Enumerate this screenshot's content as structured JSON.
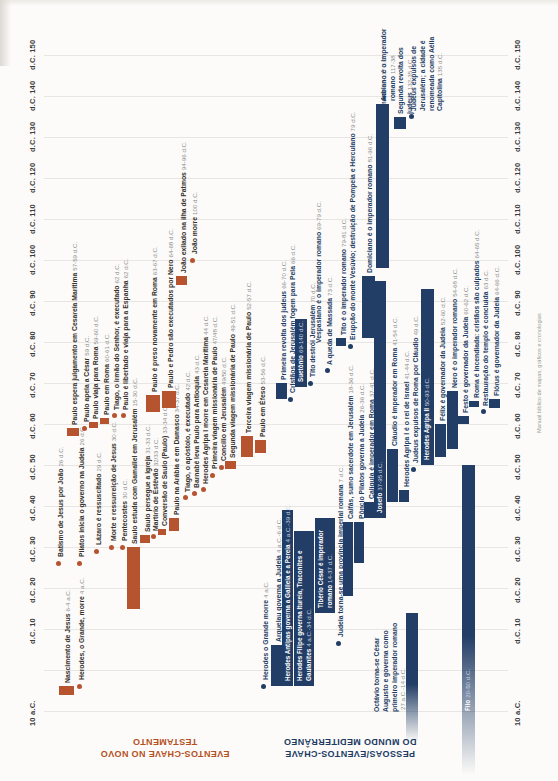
{
  "page": {
    "caption_right": "Manual bíblico de mapas, gráficos e cronologias"
  },
  "chart_data": {
    "type": "bar",
    "subtype": "gantt-timeline-vertical",
    "axis": {
      "start_year": -10,
      "end_year": 150,
      "top_y": 55,
      "px_per_year": 4.1,
      "grid_x1": 44,
      "grid_x2": 508,
      "left_tick_x": 28,
      "right_tick_x": 513,
      "gridline_years": [
        -10,
        0,
        10,
        20,
        30,
        40,
        50,
        60,
        70,
        80,
        90,
        100,
        110,
        120,
        130,
        140,
        150
      ],
      "ticks": [
        {
          "year": -10,
          "label": "10 a.C."
        },
        {
          "year": 10,
          "label": "d.C. 10"
        },
        {
          "year": 20,
          "label": "d.C. 20"
        },
        {
          "year": 30,
          "label": "d.C. 30"
        },
        {
          "year": 40,
          "label": "d.C. 40"
        },
        {
          "year": 50,
          "label": "d.C. 50"
        },
        {
          "year": 60,
          "label": "d.C. 60"
        },
        {
          "year": 70,
          "label": "d.C. 70"
        },
        {
          "year": 80,
          "label": "d.C. 80"
        },
        {
          "year": 90,
          "label": "d.C. 90"
        },
        {
          "year": 100,
          "label": "d.C. 100"
        },
        {
          "year": 110,
          "label": "d.C. 110"
        },
        {
          "year": 120,
          "label": "d.C. 120"
        },
        {
          "year": 130,
          "label": "d.C. 130"
        },
        {
          "year": 140,
          "label": "d.C. 140"
        },
        {
          "year": 150,
          "label": "d.C. 150"
        }
      ]
    },
    "sections": [
      {
        "id": "nt",
        "title_lines": [
          "EVENTOS-CHAVE NO NOVO",
          "TESTAMENTO"
        ],
        "title_color": "#b5501f",
        "marker_color": "#b65430",
        "title_left": 65,
        "title_top": 736,
        "title_width": 200
      },
      {
        "id": "med",
        "title_lines": [
          "PESSOAS/EVENTOS-CHAVE",
          "DO MUNDO MEDITERRÂNEO"
        ],
        "title_color": "#1d3c64",
        "marker_color": "#223d66",
        "title_left": 235,
        "title_top": 736,
        "title_width": 230
      }
    ],
    "events": [
      {
        "section": "nt",
        "label": "Nascimento de Jesus",
        "date": "6-4 a.C.",
        "start": -6,
        "end": -4,
        "marker": "bar",
        "x": 64,
        "bx": 59,
        "w": 15
      },
      {
        "section": "nt",
        "label": "Herodes, o Grande, morre",
        "date": "4 a.C.",
        "start": -4,
        "marker": "dot",
        "x": 78
      },
      {
        "section": "nt",
        "label": "Batismo de Jesus por João",
        "date": "26 d.C.",
        "start": 26,
        "marker": "dot",
        "x": 57
      },
      {
        "section": "nt",
        "label": "Pilatos inicia o governo na Judeia",
        "date": "26 d.C.",
        "start": 26,
        "marker": "dot",
        "x": 78
      },
      {
        "section": "nt",
        "label": "Lázaro é ressuscitado",
        "date": "29 d.C.",
        "start": 29,
        "marker": "dot",
        "x": 95
      },
      {
        "section": "nt",
        "label": "Morte e ressurreição de Jesus",
        "date": "30 d.C.",
        "start": 30,
        "marker": "dot",
        "x": 110
      },
      {
        "section": "nt",
        "label": "Pentecostes",
        "date": "30 d.C.",
        "start": 30,
        "marker": "dot",
        "x": 121
      },
      {
        "section": "nt",
        "label": "Saulo estuda com Gamaliel em Jerusalém",
        "date": "15-30 d.C.",
        "start": 15,
        "end": 30,
        "marker": "bar",
        "x": 131,
        "bx": 127,
        "w": 13
      },
      {
        "section": "nt",
        "label": "Saulo persegue a igreja",
        "date": "31-33 d.C.",
        "start": 31,
        "end": 33,
        "marker": "bar",
        "x": 144,
        "bx": 140,
        "w": 10
      },
      {
        "section": "nt",
        "label": "Martírio de Estêvão",
        "date": "32/33 d.C.",
        "start": 32.5,
        "marker": "dot",
        "x": 152
      },
      {
        "section": "nt",
        "label": "Conversão de Saulo (Paulo)",
        "date": "33-34 d.C.",
        "start": 33,
        "end": 34.5,
        "marker": "bar",
        "x": 161,
        "bx": 158,
        "w": 8
      },
      {
        "section": "nt",
        "label": "Paulo na Arábia e em Damasco",
        "date": "34-37 d.C.",
        "start": 34,
        "end": 37,
        "marker": "bar",
        "x": 173,
        "bx": 169,
        "w": 10
      },
      {
        "section": "nt",
        "label": "Tiago, o apóstolo, é executado",
        "date": "42 d.C.",
        "start": 42,
        "marker": "dot",
        "x": 184
      },
      {
        "section": "nt",
        "label": "Barnabé leva Paulo para Antioquia",
        "date": "43 d.C.",
        "start": 43,
        "marker": "dot",
        "x": 193
      },
      {
        "section": "nt",
        "label": "Herodes Agripa I morre em Cesareia Marítima",
        "date": "44 d.C.",
        "start": 44,
        "marker": "dot",
        "x": 202
      },
      {
        "section": "nt",
        "label": "Primeira viagem missionária de Paulo",
        "date": "47/48 d.C.",
        "start": 47.5,
        "marker": "dot",
        "x": 211
      },
      {
        "section": "nt",
        "label": "Concílio em Jerusalém",
        "date": "49/50 d.C.",
        "start": 49.5,
        "marker": "dot",
        "x": 220
      },
      {
        "section": "nt",
        "label": "Segunda viagem missionária de Paulo",
        "date": "49-51 d.C.",
        "start": 49,
        "end": 51,
        "marker": "bar",
        "x": 229,
        "bx": 225,
        "w": 11
      },
      {
        "section": "nt",
        "label": "Terceira viagem missionária de Paulo",
        "date": "52-57 d.C.",
        "start": 52,
        "end": 57,
        "marker": "bar",
        "x": 245,
        "bx": 241,
        "w": 12
      },
      {
        "section": "nt",
        "label": "Paulo em Éfeso",
        "date": "53-56 d.C.",
        "start": 53,
        "end": 56,
        "marker": "bar",
        "x": 259,
        "bx": 255,
        "w": 11
      },
      {
        "section": "nt",
        "label": "Paulo espera julgamento em Cesareia Marítima",
        "date": "57-59 d.C.",
        "start": 57,
        "end": 59,
        "marker": "bar",
        "x": 71,
        "bx": 67,
        "w": 12
      },
      {
        "section": "nt",
        "label": "Paulo apela a César",
        "date": "59 d.C.",
        "start": 59,
        "marker": "dot",
        "x": 83
      },
      {
        "section": "nt",
        "label": "Paulo viaja para Roma",
        "date": "59-60 d.C.",
        "start": 59,
        "end": 60.5,
        "marker": "bar",
        "x": 92,
        "bx": 89,
        "w": 9
      },
      {
        "section": "nt",
        "label": "Paulo em Roma",
        "date": "60-61 d.C.",
        "start": 60,
        "end": 61.5,
        "marker": "bar",
        "x": 103,
        "bx": 100,
        "w": 9
      },
      {
        "section": "nt",
        "label": "Tiago, o irmão do Senhor, é executado",
        "date": "62 d.C.",
        "start": 62,
        "marker": "dot",
        "x": 113
      },
      {
        "section": "nt",
        "label": "Paulo é libertado e viaja para a Espanha",
        "date": "62 d.C.",
        "start": 62,
        "marker": "dot",
        "x": 122
      },
      {
        "section": "nt",
        "label": "Paulo é preso novamente em Roma",
        "date": "63-67 d.C.",
        "start": 63,
        "end": 67,
        "marker": "bar",
        "x": 151,
        "bx": 146,
        "w": 14
      },
      {
        "section": "nt",
        "label": "Paulo e Pedro são executados por Nero",
        "date": "64-68 d.C.",
        "start": 64,
        "end": 68,
        "marker": "bar",
        "x": 167,
        "bx": 162,
        "w": 14
      },
      {
        "section": "nt",
        "label": "João exilado na ilha de Patmos",
        "date": "94-96 d.C.",
        "start": 94,
        "end": 96,
        "marker": "bar",
        "x": 180,
        "bx": 176,
        "w": 11
      },
      {
        "section": "nt",
        "label": "João morre",
        "date": "100 d.C.",
        "start": 100,
        "marker": "dot",
        "x": 191
      },
      {
        "section": "med",
        "label": "Herodes o Grande morre",
        "date": "4 a.C.",
        "start": -4,
        "marker": "dot",
        "x": 262
      },
      {
        "section": "med",
        "label": "Arquelau governa a Judeia",
        "date": "4 a.C.-6 d.C.",
        "start": -4,
        "end": 6,
        "marker": "bar",
        "x": 275,
        "bx": 271,
        "w": 11
      },
      {
        "section": "med",
        "label": "Herodes Antipas governa a Galileia e a Pereia",
        "date": "4 a.C.-39 d.C.",
        "start": -4,
        "end": 39,
        "marker": "bar",
        "inside": true,
        "x": 284,
        "bx": 282,
        "w": 11
      },
      {
        "section": "med",
        "lines": [
          "Herodes Filipe governa Itureia, Traconites e",
          "Gaulanites"
        ],
        "label": "Herodes Filipe governa Itureia, Traconites e Gaulanites",
        "date": "4 a.C.-34 d.C.",
        "start": -4,
        "end": 34,
        "marker": "bar",
        "inside": true,
        "x": 297,
        "bx": 294,
        "w": 20
      },
      {
        "section": "med",
        "lines": [
          "Tibério César é imperador",
          "romano"
        ],
        "label": "Tibério César é imperador romano",
        "date": "14-37 d.C.",
        "start": 14,
        "end": 37,
        "marker": "bar",
        "inside": true,
        "x": 318,
        "bx": 315,
        "w": 20
      },
      {
        "section": "med",
        "label": "Judeia torna-se uma província imperial romana",
        "date": "7 d.C.",
        "start": 6.5,
        "marker": "dot",
        "x": 337
      },
      {
        "section": "med",
        "label": "Caifás, sumo sacerdote em Jerusalém",
        "date": "18-36 d.C.",
        "start": 18,
        "end": 36,
        "marker": "bar",
        "x": 347,
        "bx": 343,
        "w": 10
      },
      {
        "section": "med",
        "label": "Pôncio Pilatos governa a Judeia",
        "date": "26-36 d.C.",
        "start": 26,
        "end": 36,
        "marker": "bar",
        "x": 358,
        "bx": 354,
        "w": 10
      },
      {
        "section": "med",
        "label": "Calígula é imperador em Roma",
        "date": "37-41 d.C.",
        "start": 37,
        "end": 41,
        "marker": "bar",
        "x": 368,
        "bx": 364,
        "w": 10
      },
      {
        "section": "med",
        "label": "Josefo",
        "date": "37-95 d.C.",
        "start": 37,
        "end": 95,
        "marker": "bar",
        "inside": true,
        "x": 377,
        "bx": 374,
        "w": 12
      },
      {
        "section": "med",
        "label": "Cláudio é imperador em Roma",
        "date": "41-54 d.C.",
        "start": 41,
        "end": 54,
        "marker": "bar",
        "x": 391,
        "bx": 387,
        "w": 11
      },
      {
        "section": "med",
        "label": "Herodes Agripa I é o rei de Israel",
        "date": "41-44 d.C.",
        "start": 41,
        "end": 44,
        "marker": "bar",
        "x": 403,
        "bx": 399,
        "w": 10
      },
      {
        "section": "med",
        "label": "Judeus expulsos de Roma por Cláudio",
        "date": "49 d.C.",
        "start": 49,
        "marker": "dot",
        "x": 412
      },
      {
        "section": "med",
        "label": "Herodes Agripa II",
        "date": "50-93 d.C.",
        "start": 50,
        "end": 93,
        "marker": "bar",
        "inside": true,
        "x": 424,
        "bx": 421,
        "w": 13
      },
      {
        "section": "med",
        "label": "Félix é governador da Judeia",
        "date": "52-60 d.C.",
        "start": 52,
        "end": 60,
        "marker": "bar",
        "x": 439,
        "bx": 435,
        "w": 11
      },
      {
        "section": "med",
        "label": "Nero é o imperador romano",
        "date": "54-68 d.C.",
        "start": 54,
        "end": 68,
        "marker": "bar",
        "x": 451,
        "bx": 447,
        "w": 11
      },
      {
        "section": "med",
        "label": "Festo é governador da Judeia",
        "date": "60-62 d.C.",
        "start": 60,
        "end": 62,
        "marker": "bar",
        "x": 462,
        "bx": 458,
        "w": 11
      },
      {
        "section": "med",
        "label": "Roma é incendiada: cristãos são culpados",
        "date": "64-65 d.C.",
        "start": 64,
        "end": 65.5,
        "marker": "bar",
        "x": 473,
        "bx": 469,
        "w": 10
      },
      {
        "section": "med",
        "label": "Restauração do templo é concluída",
        "date": "63 d.C.",
        "start": 63,
        "marker": "dot",
        "x": 482
      },
      {
        "section": "med",
        "label": "Flórus é governador da Judeia",
        "date": "64-66 d.C.",
        "start": 64,
        "end": 66,
        "marker": "bar",
        "x": 493,
        "bx": 489,
        "w": 11
      },
      {
        "section": "med",
        "label": "Primeira revolta dos judeus",
        "date": "66-70 d.C.",
        "start": 66,
        "end": 70,
        "marker": "bar",
        "x": 280,
        "bx": 276,
        "w": 11
      },
      {
        "section": "med",
        "label": "Cristãos de Jerusalém fogem para Pela",
        "date": "66 d.C.",
        "start": 66,
        "marker": "dot",
        "x": 289
      },
      {
        "section": "med",
        "label": "Suetônio",
        "date": "69-140 d.C.",
        "start": 69,
        "end": 140,
        "vend": 85.5,
        "marker": "bar",
        "inside": true,
        "x": 298,
        "bx": 295,
        "w": 12
      },
      {
        "section": "med",
        "label": "Tito destrói Jerusalém",
        "date": "70 d.C.",
        "start": 70,
        "marker": "dot",
        "x": 309
      },
      {
        "section": "med",
        "label": "Vespasiano é o imperador romano",
        "date": "69-79 d.C.",
        "start": 69,
        "end": 79,
        "marker": "none",
        "x": 315
      },
      {
        "section": "med",
        "label": "A queda de Massada",
        "date": "73 d.C.",
        "start": 73,
        "marker": "dot",
        "x": 326
      },
      {
        "section": "med",
        "label": "Tito é o imperador romano",
        "date": "79-81 d.C.",
        "start": 79,
        "end": 81,
        "marker": "bar",
        "x": 340,
        "bx": 336,
        "w": 10
      },
      {
        "section": "med",
        "label": "Erupção do monte Vesúvio; destruição de Pompeia e Herculano",
        "date": "79 d.C.",
        "start": 79,
        "marker": "dot",
        "x": 349
      },
      {
        "section": "med",
        "label": "Domiciano é o imperador romano",
        "date": "81-96 d.C.",
        "start": 81,
        "end": 96,
        "marker": "bar",
        "x": 366,
        "bx": 362,
        "w": 13
      },
      {
        "section": "med",
        "label": "Trajano é o imperador romano",
        "date": "98-117 d.C.",
        "start": 98,
        "end": 117,
        "marker": "bar",
        "x": 380,
        "bx": 376,
        "w": 13
      },
      {
        "section": "med",
        "lines": [
          "Adriano é o imperador",
          "romano"
        ],
        "label": "Adriano é o imperador romano",
        "date": "117-38",
        "start": 117,
        "end": 138,
        "marker": "bar",
        "x": 380,
        "bx": 376,
        "w": 13
      },
      {
        "section": "med",
        "lines": [
          "Segunda revolta dos",
          "judeus"
        ],
        "label": "Segunda revolta dos judeus",
        "date": "132-35 d.C.",
        "start": 132,
        "end": 135,
        "marker": "bar",
        "x": 397,
        "bx": 394,
        "w": 12
      },
      {
        "section": "med",
        "lines": [
          "Judeus expulsos de",
          "Jerusalém; a cidade é",
          "renomeada como Aélia",
          "Capitolina"
        ],
        "label": "Judeus expulsos de Jerusalém; a cidade é renomeada como Aélia Capitolina",
        "date": "135 d.C.",
        "start": 135,
        "marker": "dot",
        "x": 410
      },
      {
        "section": "med",
        "lines": [
          "Octávio torna-se César",
          "Augusto e governa como",
          "primeiro imperador romano"
        ],
        "label": "Octávio torna-se César Augusto e governa como primeiro imperador romano",
        "date": "27 a.C.-14 d.C.",
        "date_own_line": true,
        "start": -27,
        "end": 14,
        "marker": "bar-fade-bottom",
        "fade_bottom": 742,
        "ly": 712,
        "x": 373,
        "bx": 406,
        "w": 12
      },
      {
        "section": "med",
        "label": "Filo",
        "date": "20-50 d.C.",
        "start": -20,
        "end": 50,
        "marker": "bar-fade-bottom",
        "fade_bottom": 775,
        "inside": true,
        "ly": 711,
        "x": 465,
        "bx": 462,
        "w": 13
      }
    ]
  }
}
